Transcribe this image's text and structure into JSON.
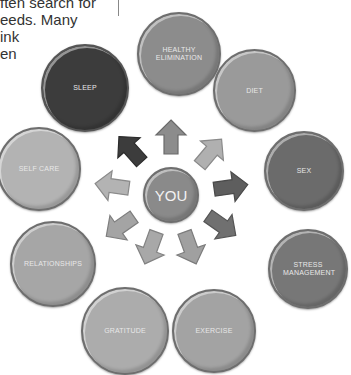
{
  "background_text": {
    "lines": [
      "ften search for",
      "eeds. Many",
      "ink",
      "en"
    ]
  },
  "diagram": {
    "center": {
      "label": "YOU",
      "color": "#8a8a8a"
    },
    "nodes": [
      {
        "id": "healthy-elimination",
        "label": "HEALTHY ELIMINATION",
        "color": "#8c8c8c"
      },
      {
        "id": "diet",
        "label": "DIET",
        "color": "#9a9a9a"
      },
      {
        "id": "sex",
        "label": "SEX",
        "color": "#6b6b6b"
      },
      {
        "id": "stress-management",
        "label": "STRESS MANAGEMENT",
        "color": "#777777"
      },
      {
        "id": "exercise",
        "label": "EXERCISE",
        "color": "#a3a3a3"
      },
      {
        "id": "gratitude",
        "label": "GRATITUDE",
        "color": "#acacac"
      },
      {
        "id": "relationships",
        "label": "RELATIONSHIPS",
        "color": "#a6a6a6"
      },
      {
        "id": "self-care",
        "label": "SELF CARE",
        "color": "#b3b3b3"
      },
      {
        "id": "sleep",
        "label": "SLEEP",
        "color": "#3c3c3c"
      }
    ],
    "arrow_colors": {
      "up": "#8c8c8c",
      "up-right": "#b0b0b0",
      "right": "#5e5e5e",
      "down-right": "#707070",
      "down-right-low": "#a0a0a0",
      "down-left-low": "#a8a8a8",
      "down-left": "#a4a4a4",
      "left": "#b3b3b3",
      "up-left": "#3c3c3c"
    }
  }
}
